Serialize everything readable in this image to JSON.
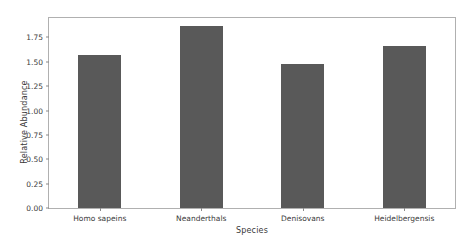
{
  "chart_data": {
    "type": "bar",
    "title": "",
    "xlabel": "Species",
    "ylabel": "Relative Abundance",
    "categories": [
      "Homo sapeins",
      "Neanderthals",
      "Denisovans",
      "Heidelbergensis"
    ],
    "values": [
      1.57,
      1.87,
      1.48,
      1.66
    ],
    "ylim": [
      0.0,
      1.95
    ],
    "yticks": [
      "0.00",
      "0.25",
      "0.50",
      "0.75",
      "1.00",
      "1.25",
      "1.50",
      "1.75"
    ],
    "ytick_values": [
      0.0,
      0.25,
      0.5,
      0.75,
      1.0,
      1.25,
      1.5,
      1.75
    ],
    "grid": false,
    "legend": null,
    "bar_color": "#595959",
    "axes_color": "#b0b0b0",
    "background_color": "#ffffff"
  }
}
